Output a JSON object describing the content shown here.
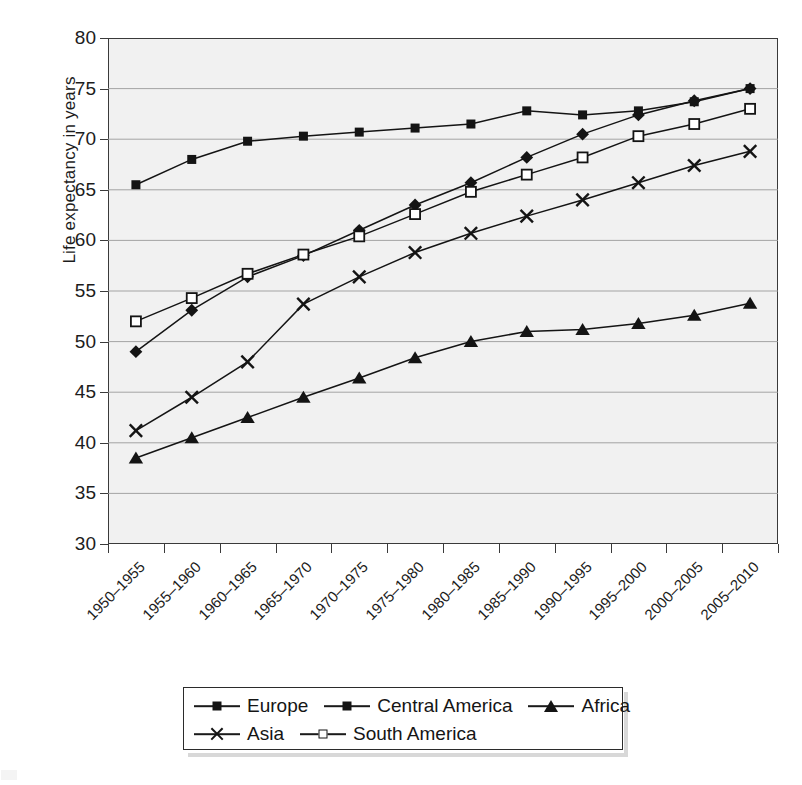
{
  "chart_data": {
    "type": "line",
    "title": "",
    "xlabel": "",
    "ylabel": "Life expectancy in years",
    "ylim": [
      30,
      80
    ],
    "ytick_step": 5,
    "yticks": [
      80,
      75,
      70,
      65,
      60,
      55,
      50,
      45,
      40,
      35,
      30
    ],
    "grid": true,
    "grid_axis": "y",
    "legend_position": "bottom",
    "plot_background": "#f1f1f1",
    "series_color": "#141414",
    "categories": [
      "1950–1955",
      "1955–1960",
      "1960–1965",
      "1965–1970",
      "1970–1975",
      "1975–1980",
      "1980–1985",
      "1985–1990",
      "1990–1995",
      "1995–2000",
      "2000–2005",
      "2005–2010"
    ],
    "series": [
      {
        "name": "Europe",
        "marker": "filled-square",
        "values": [
          65.5,
          68.0,
          69.8,
          70.3,
          70.7,
          71.1,
          71.5,
          72.8,
          72.4,
          72.8,
          73.7,
          75.0
        ]
      },
      {
        "name": "Central America",
        "marker": "filled-diamond",
        "values": [
          49.0,
          53.1,
          56.4,
          58.5,
          61.0,
          63.5,
          65.7,
          68.2,
          70.5,
          72.4,
          73.8,
          75.0
        ]
      },
      {
        "name": "Africa",
        "marker": "filled-triangle",
        "values": [
          38.5,
          40.5,
          42.5,
          44.5,
          46.4,
          48.4,
          50.0,
          51.0,
          51.2,
          51.8,
          52.6,
          53.8
        ]
      },
      {
        "name": "Asia",
        "marker": "cross",
        "values": [
          41.2,
          44.5,
          48.0,
          53.7,
          56.4,
          58.8,
          60.7,
          62.4,
          64.0,
          65.7,
          67.4,
          68.8
        ]
      },
      {
        "name": "South America",
        "marker": "open-square",
        "values": [
          52.0,
          54.3,
          56.7,
          58.6,
          60.4,
          62.6,
          64.8,
          66.5,
          68.2,
          70.3,
          71.5,
          73.0
        ]
      }
    ]
  },
  "legend": {
    "rows": [
      [
        "Europe",
        "Central America",
        "Africa"
      ],
      [
        "Asia",
        "South America"
      ]
    ]
  }
}
